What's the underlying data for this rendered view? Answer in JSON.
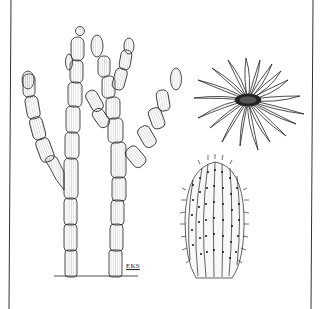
{
  "illustration": {
    "subject": "botanical line drawing of cacti",
    "panels": [
      {
        "name": "branching columnar cactus",
        "position": "left"
      },
      {
        "name": "cactus flower",
        "position": "top-right"
      },
      {
        "name": "spiny barrel cactus",
        "position": "bottom-right"
      }
    ],
    "signature": "EKS",
    "colors": {
      "ink": "#1a1a1a",
      "background": "#ffffff",
      "hatch": "#888888"
    }
  }
}
